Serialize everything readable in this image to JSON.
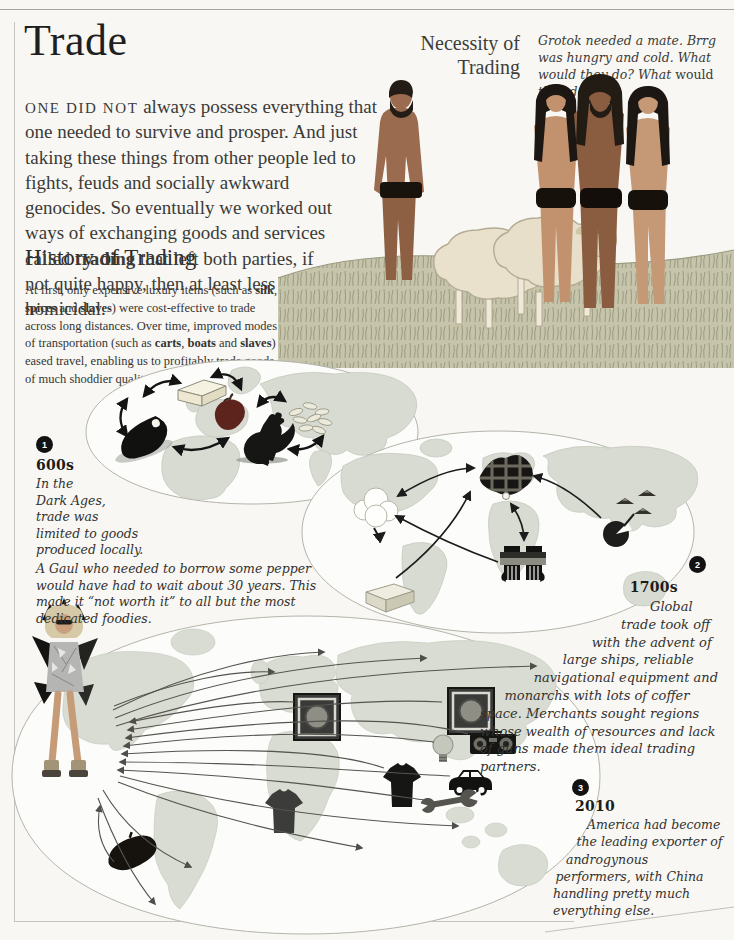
{
  "title": "Trade",
  "intro_segments": [
    {
      "t": "ONE DID NOT",
      "cls": "sc"
    },
    {
      "t": " always possess everything that one needed to survive and prosper. And just taking these things from other people led to fights, feuds and socially awkward genocides. So eventually we worked out ways of exchanging goods and services called "
    },
    {
      "t": "trading",
      "cls": "b"
    },
    {
      "t": " that left both parties, if not quite happy, then at least less homicidal."
    }
  ],
  "necessity": {
    "heading_1": "Necessity of",
    "heading_2": "Trading",
    "caption_segments": [
      {
        "t": "Grotok needed a mate. Brrg was hungry and cold. What would they do? What "
      },
      {
        "t": "would",
        "cls": "rm"
      },
      {
        "t": " they do?"
      }
    ]
  },
  "history": {
    "heading": "History of Trading",
    "body_segments": [
      {
        "t": "At first, only expensive luxury items (such as "
      },
      {
        "t": "silk",
        "cls": "b"
      },
      {
        "t": ", "
      },
      {
        "t": "spices",
        "cls": "b"
      },
      {
        "t": " and "
      },
      {
        "t": "slaves",
        "cls": "b"
      },
      {
        "t": ") were cost-effective to trade across long distances. Over time, improved modes of transportation (such as "
      },
      {
        "t": "carts",
        "cls": "b"
      },
      {
        "t": ", "
      },
      {
        "t": "boats",
        "cls": "b"
      },
      {
        "t": " and "
      },
      {
        "t": "slaves",
        "cls": "b"
      },
      {
        "t": ") eased travel, enabling us to profitably trade goods of much shoddier quality."
      }
    ]
  },
  "era1": {
    "badge": "1",
    "year": "600s",
    "body_narrow_segments": [
      {
        "t": "In the Dark Ages, trade was limited to goods produced locally."
      }
    ],
    "body_rest_segments": [
      {
        "t": "A Gaul who needed to borrow some pepper would have had to wait about 30 years. This made it “not worth it” to all but the most dedicated foodies."
      }
    ]
  },
  "era2": {
    "badge": "2",
    "year": "1700s",
    "body_segments": [
      {
        "t": "Global trade took off with the advent of large ships, reliable navigational equipment and monarchs with lots of coffer space. Merchants sought regions whose wealth of resources and lack of guns made them ideal trading partners."
      }
    ]
  },
  "era3": {
    "badge": "3",
    "year": "2010",
    "body_segments": [
      {
        "t": "America had become the leading exporter of androgynous performers, with China handling pretty much everything else."
      }
    ]
  },
  "illustration": {
    "name": "cavemen-necessity-scene",
    "elements": [
      "caveman-with-sheep",
      "sheep",
      "sheep",
      "caveman",
      "mate",
      "mate",
      "grass-field"
    ]
  },
  "maps": {
    "map1": {
      "name": "600s-local-trade-map",
      "icons": [
        "ham",
        "cheese",
        "apple",
        "rooster",
        "rice-grains"
      ]
    },
    "map2": {
      "name": "1700s-global-trade-map",
      "icons": [
        "cotton",
        "tartan-cloth",
        "shackled-hands",
        "tea-pot-and-hats",
        "gold-ingot"
      ]
    },
    "map3": {
      "name": "2010-global-trade-map",
      "icons": [
        "androgynous-performer",
        "guitar-amp",
        "guitar-amp",
        "boombox",
        "lightbulb",
        "t-shirt",
        "t-shirt",
        "car",
        "wrench",
        "beret"
      ]
    }
  },
  "colors": {
    "page_bg": "#f8f7f4",
    "text": "#3a3a3a",
    "icon_black": "#151513",
    "map_land": "#d7dbd1",
    "map_ocean": "#fcfcfa",
    "map_outline": "#b4b4ab"
  }
}
